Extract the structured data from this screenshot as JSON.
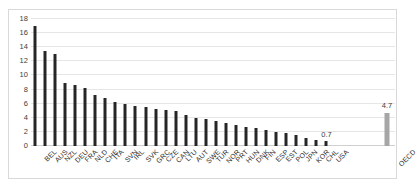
{
  "chart_data": {
    "type": "bar",
    "title": "",
    "subtitle": "",
    "xlabel": "",
    "ylabel": "",
    "ylim": [
      0,
      18
    ],
    "yticks": [
      0,
      2,
      4,
      6,
      8,
      10,
      12,
      14,
      16,
      18
    ],
    "grid": true,
    "legend": "none",
    "categories": [
      "BEL",
      "AUS",
      "NZL",
      "DEU",
      "FRA",
      "NLD",
      "CHE",
      "ITA",
      "SVN",
      "IRL",
      "SVK",
      "GRC",
      "CZE",
      "CAN",
      "LTU",
      "AUT",
      "SWE",
      "TUR",
      "NOR",
      "PRT",
      "HUN",
      "DNK",
      "FIN",
      "ESP",
      "EST",
      "POL",
      "JPN",
      "KOR",
      "CHL",
      "USA",
      "OECD"
    ],
    "values": [
      17.0,
      13.5,
      13.0,
      9.0,
      8.7,
      8.2,
      7.3,
      6.8,
      6.2,
      5.9,
      5.7,
      5.5,
      5.3,
      5.1,
      4.9,
      4.4,
      4.0,
      3.8,
      3.5,
      3.2,
      3.0,
      2.7,
      2.5,
      2.3,
      2.0,
      1.8,
      1.5,
      1.2,
      0.9,
      0.7,
      4.7
    ],
    "highlight_category": "OECD",
    "series_colors": {
      "country_bar": "#262626",
      "aggregate_bar": "#a6a6a6",
      "gridline": "#e6e6e6",
      "border": "#d9d9d9",
      "text": "#2b2b2b"
    },
    "data_labels": [
      {
        "category": "USA",
        "text": "0.7"
      },
      {
        "category": "OECD",
        "text": "4.7"
      }
    ]
  }
}
